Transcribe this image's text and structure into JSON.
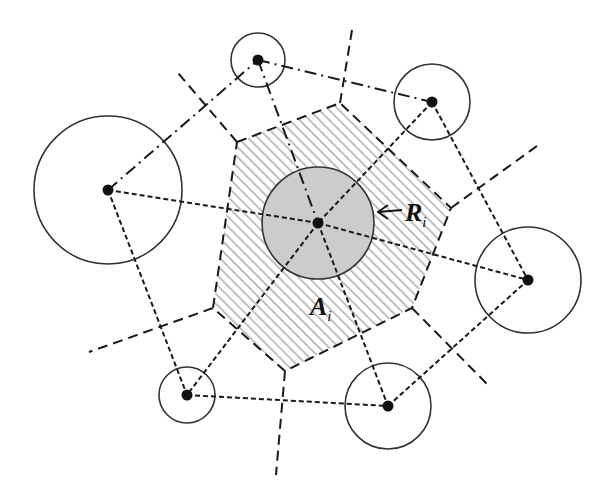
{
  "figure": {
    "labels": {
      "radius": {
        "main": "R",
        "sub": "i"
      },
      "area": {
        "main": "A",
        "sub": "i"
      }
    },
    "colors": {
      "stroke": "#1a1a1a",
      "central_fill": "#cccccc",
      "hatch": "#b8b8b8",
      "background": "#ffffff"
    },
    "nodes": [
      {
        "id": "center",
        "x": 318,
        "y": 223,
        "r": 56,
        "shaded": true
      },
      {
        "id": "top",
        "x": 258,
        "y": 60,
        "r": 27
      },
      {
        "id": "top-right",
        "x": 432,
        "y": 102,
        "r": 38
      },
      {
        "id": "left",
        "x": 108,
        "y": 190,
        "r": 74
      },
      {
        "id": "right",
        "x": 528,
        "y": 280,
        "r": 53
      },
      {
        "id": "bottom-left",
        "x": 187,
        "y": 395,
        "r": 28
      },
      {
        "id": "bottom",
        "x": 388,
        "y": 406,
        "r": 43
      }
    ],
    "voronoi_cell": [
      [
        237,
        142
      ],
      [
        340,
        103
      ],
      [
        451,
        208
      ],
      [
        412,
        308
      ],
      [
        285,
        371
      ],
      [
        213,
        308
      ]
    ]
  }
}
